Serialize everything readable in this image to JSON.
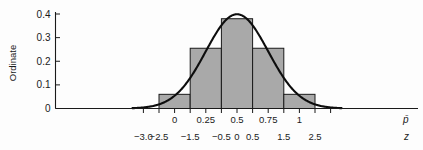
{
  "chart_data": {
    "type": "bar",
    "title": "",
    "subtitle": "",
    "ylabel": "Ordinate",
    "xlabel_primary": "p̄",
    "xlabel_secondary": "z",
    "ylim": [
      0,
      0.42
    ],
    "ytick_values": [
      0,
      0.1,
      0.2,
      0.3,
      0.4
    ],
    "ytick_labels": [
      "0",
      "0.1",
      "0.2",
      "0.3",
      "0.4"
    ],
    "xlim_z": [
      -3.4,
      3.4
    ],
    "xticks_p": {
      "z_positions": [
        -2.0,
        -1.0,
        0.0,
        1.0,
        2.0
      ],
      "labels": [
        "0",
        "0.25",
        "0.5",
        "0.75",
        "1"
      ]
    },
    "xticks_z": {
      "z_positions": [
        -3.0,
        -2.5,
        -1.5,
        -0.5,
        0.0,
        0.5,
        1.5,
        2.5
      ],
      "labels": [
        "−3.0",
        "−2.5",
        "−1.5",
        "−0.5",
        "0",
        "0.5",
        "1.5",
        "2.5"
      ]
    },
    "minor_tick_z_positions": [
      -3.0,
      -2.5,
      -2.0,
      -1.5,
      -1.0,
      -0.5,
      0.0,
      0.5,
      1.0,
      1.5,
      2.0,
      2.5,
      3.0
    ],
    "bars": [
      {
        "z_left": -2.5,
        "z_right": -1.5,
        "height": 0.06
      },
      {
        "z_left": -1.5,
        "z_right": -0.5,
        "height": 0.255
      },
      {
        "z_left": -0.5,
        "z_right": 0.5,
        "height": 0.38
      },
      {
        "z_left": 0.5,
        "z_right": 1.5,
        "height": 0.255
      },
      {
        "z_left": 1.5,
        "z_right": 2.5,
        "height": 0.06
      }
    ],
    "curve": {
      "name": "normal-density",
      "mean_z": 0.0,
      "sd_z": 1.0,
      "peak_value": 0.3989,
      "z_range": [
        -3.35,
        3.35
      ]
    },
    "grid": false,
    "legend": null,
    "colors": {
      "bar_fill": "#a9a9a9",
      "bar_stroke": "#1a1a1a",
      "curve": "#0d0d0d",
      "axis": "#1a1a1a",
      "background": "#fdfdfd"
    }
  }
}
